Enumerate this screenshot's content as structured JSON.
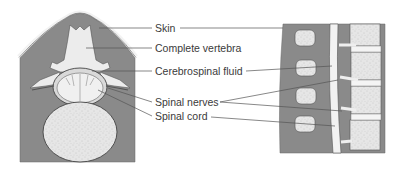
{
  "diagram": {
    "panels": [
      {
        "name": "cross-section",
        "description": "Transverse section through vertebra and spinal cord"
      },
      {
        "name": "longitudinal-section",
        "description": "Sagittal section of vertebral column"
      }
    ],
    "labels": [
      {
        "id": "skin",
        "text": "Skin"
      },
      {
        "id": "complete-vertebra",
        "text": "Complete vertebra"
      },
      {
        "id": "cerebrospinal-fluid",
        "text": "Cerebrospinal fluid"
      },
      {
        "id": "spinal-nerves",
        "text": "Spinal nerves"
      },
      {
        "id": "spinal-cord",
        "text": "Spinal cord"
      }
    ],
    "colors": {
      "tissue": "#8a8a8a",
      "bone": "#ececec",
      "bone_texture": "#d4d4d4",
      "outline": "#444444",
      "background": "#ffffff"
    }
  }
}
